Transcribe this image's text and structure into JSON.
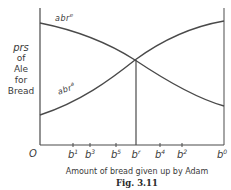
{
  "figure": {
    "caption": "Fig. 3.11",
    "ylabel": {
      "line1": "prs",
      "line2": "of",
      "line3": "Ale",
      "line4": "for",
      "line5": "Bread"
    },
    "xlabel": "Amount of bread given up by Adam",
    "origin_label": "O",
    "curves": [
      {
        "name": "abr",
        "superscript": "e",
        "direction": "decreasing"
      },
      {
        "name": "abr",
        "superscript": "a",
        "direction": "increasing"
      }
    ],
    "ticks": [
      {
        "base": "b",
        "sup": "1",
        "x": 73
      },
      {
        "base": "b",
        "sup": "3",
        "x": 90
      },
      {
        "base": "b",
        "sup": "5",
        "x": 116
      },
      {
        "base": "b",
        "sup": "r",
        "x": 136
      },
      {
        "base": "b",
        "sup": "4",
        "x": 160
      },
      {
        "base": "b",
        "sup": "2",
        "x": 182
      },
      {
        "base": "b",
        "sup": "0",
        "x": 224
      }
    ],
    "colors": {
      "line": "#4a4a4a",
      "text": "#3a3a3a",
      "background": "#ffffff"
    }
  }
}
